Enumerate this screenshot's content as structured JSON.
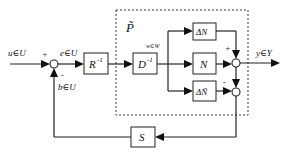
{
  "diagram": {
    "type": "block-diagram",
    "group": {
      "label": "P̃",
      "style": "dashed"
    },
    "blocks": [
      {
        "id": "Rinv",
        "label": "R",
        "sup": "-1"
      },
      {
        "id": "Dinv",
        "label": "D",
        "sup": "-1"
      },
      {
        "id": "dN",
        "label": "ΔN"
      },
      {
        "id": "N",
        "label": "N"
      },
      {
        "id": "dNt",
        "label": "ΔÑ"
      },
      {
        "id": "S",
        "label": "S"
      }
    ],
    "signals": {
      "u": "u∈U",
      "e": "e∈U",
      "b": "b∈U",
      "w": "w∈W",
      "y": "y∈Y"
    },
    "signs": {
      "sum1_u": "+",
      "sum1_b": "-",
      "sum2_dN": "+",
      "sum3_dNt": "-"
    }
  }
}
